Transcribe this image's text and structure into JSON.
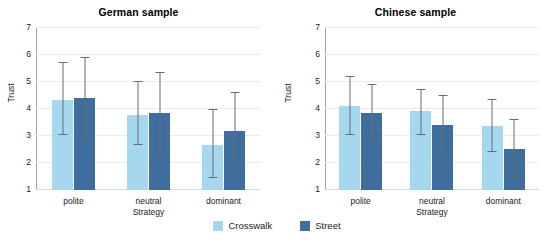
{
  "chart_data": [
    {
      "type": "bar",
      "title": "German sample",
      "xlabel": "Strategy",
      "ylabel": "Trust",
      "categories": [
        "polite",
        "neutral",
        "dominant"
      ],
      "ylim": [
        1,
        7
      ],
      "yticks": [
        "1",
        "2",
        "3",
        "4",
        "5",
        "6",
        "7"
      ],
      "grid": true,
      "legend_position": "bottom-center",
      "series": [
        {
          "name": "Crosswalk",
          "color": "#a5d8ee",
          "values": [
            4.32,
            3.78,
            2.68
          ],
          "error_low": [
            3.05,
            2.65,
            1.45
          ],
          "error_high": [
            5.72,
            5.0,
            3.95
          ]
        },
        {
          "name": "Street",
          "color": "#3f6e9e",
          "values": [
            4.42,
            3.85,
            3.18
          ],
          "error_low": [
            2.95,
            2.38,
            1.82
          ],
          "error_high": [
            5.88,
            5.35,
            4.58
          ]
        }
      ]
    },
    {
      "type": "bar",
      "title": "Chinese sample",
      "xlabel": "Strategy",
      "ylabel": "Trust",
      "categories": [
        "polite",
        "neutral",
        "dominant"
      ],
      "ylim": [
        1,
        7
      ],
      "yticks": [
        "1",
        "2",
        "3",
        "4",
        "5",
        "6",
        "7"
      ],
      "grid": true,
      "legend_position": "bottom-center",
      "series": [
        {
          "name": "Crosswalk",
          "color": "#a5d8ee",
          "values": [
            4.1,
            3.92,
            3.38
          ],
          "error_low": [
            3.02,
            3.03,
            2.42
          ],
          "error_high": [
            5.18,
            4.72,
            4.32
          ]
        },
        {
          "name": "Street",
          "color": "#3f6e9e",
          "values": [
            3.85,
            3.4,
            2.52
          ],
          "error_low": [
            2.82,
            2.3,
            1.45
          ],
          "error_high": [
            4.9,
            4.48,
            3.6
          ]
        }
      ]
    }
  ],
  "legend": {
    "items": [
      {
        "label": "Crosswalk",
        "color": "#a5d8ee"
      },
      {
        "label": "Street",
        "color": "#3f6e9e"
      }
    ]
  }
}
